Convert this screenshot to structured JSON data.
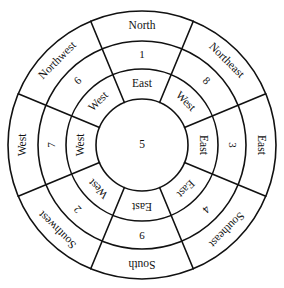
{
  "diagram": {
    "type": "concentric-ring-compass",
    "geometry": {
      "center_x": 142,
      "center_y": 145,
      "radius_inner_circle": 46,
      "radius_ring_inner_outer": 76,
      "radius_ring_middle_outer": 104,
      "radius_ring_outer_outer": 134,
      "sector_count": 8,
      "sector_degrees": 45,
      "sector_offset_degrees": 22.5
    },
    "colors": {
      "stroke": "#111111",
      "background": "#ffffff",
      "text": "#111111"
    },
    "center": {
      "label": "5"
    },
    "sectors": [
      {
        "name": "north",
        "angle_center_deg": 0,
        "outer_label": "North",
        "middle_label": "1",
        "inner_label": "East"
      },
      {
        "name": "northeast",
        "angle_center_deg": 45,
        "outer_label": "Northeast",
        "middle_label": "8",
        "inner_label": "West"
      },
      {
        "name": "east",
        "angle_center_deg": 90,
        "outer_label": "East",
        "middle_label": "3",
        "inner_label": "East"
      },
      {
        "name": "southeast",
        "angle_center_deg": 135,
        "outer_label": "Southeast",
        "middle_label": "4",
        "inner_label": "East"
      },
      {
        "name": "south",
        "angle_center_deg": 180,
        "outer_label": "South",
        "middle_label": "9",
        "inner_label": "East"
      },
      {
        "name": "southwest",
        "angle_center_deg": 225,
        "outer_label": "Southwest",
        "middle_label": "2",
        "inner_label": "West"
      },
      {
        "name": "west",
        "angle_center_deg": 270,
        "outer_label": "West",
        "middle_label": "7",
        "inner_label": "West"
      },
      {
        "name": "northwest",
        "angle_center_deg": 315,
        "outer_label": "Northwest",
        "middle_label": "6",
        "inner_label": "West"
      }
    ]
  }
}
